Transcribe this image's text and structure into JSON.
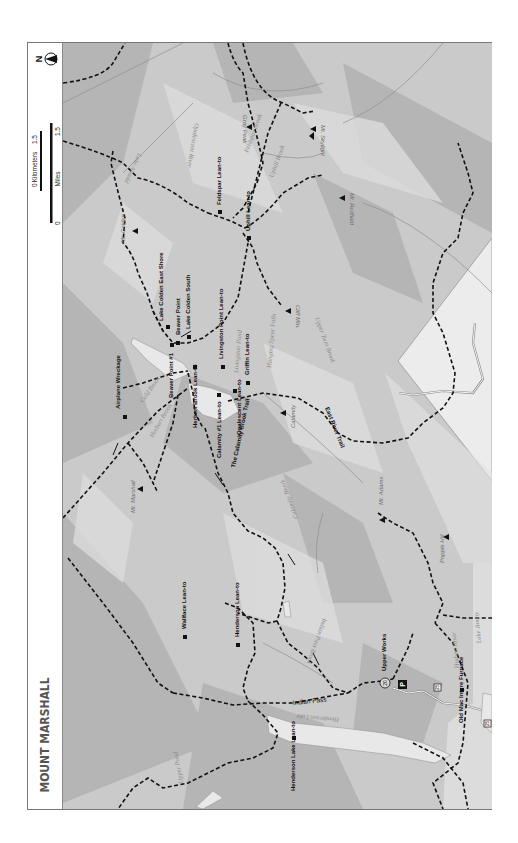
{
  "map": {
    "title": "MOUNT MARSHALL",
    "north_label": "N",
    "scale": {
      "km_label": "Kilometers",
      "km_start": "0",
      "km_end": "1.5",
      "mi_label": "Miles",
      "mi_start": "0",
      "mi_end": "1.5"
    },
    "colors": {
      "background": "#c9c9c9",
      "water": "#e6e6e6",
      "trail": "#111111",
      "label_water": "#8a8a8a",
      "label_peak": "#777777",
      "label_site": "#111111",
      "private_land": "#e9e9e9"
    },
    "lean_tos": [
      {
        "name": "Feldspar Lean-to"
      },
      {
        "name": "Uphill Lean-to"
      },
      {
        "name": "Lake Colden East Shore"
      },
      {
        "name": "Lake Colden South"
      },
      {
        "name": "Beaver Point"
      },
      {
        "name": "Beaver Point #1"
      },
      {
        "name": "Livingston Point Lean-to"
      },
      {
        "name": "Griffin Lean-to"
      },
      {
        "name": "Opalescent Lean-to"
      },
      {
        "name": "Herbert Brook Lean-to"
      },
      {
        "name": "Calamity #1 Lean-to"
      },
      {
        "name": "Airplane Wreckage"
      },
      {
        "name": "Wallface Lean-to"
      },
      {
        "name": "Henderson Lean-to"
      },
      {
        "name": "Henderson Lake Lean-to"
      },
      {
        "name": "Old Mac Intyre Furnace"
      }
    ],
    "peaks": [
      {
        "name": "Mt. Skylight"
      },
      {
        "name": "Gray Peak"
      },
      {
        "name": "Mt. Redfield"
      },
      {
        "name": "Mt. Colden"
      },
      {
        "name": "Cliff Mtn."
      },
      {
        "name": "Calamity"
      },
      {
        "name": "Mt. Marshall"
      },
      {
        "name": "Mt. Adams"
      },
      {
        "name": "Popple Hill"
      }
    ],
    "water": [
      {
        "name": "Lake Arnold"
      },
      {
        "name": "Opalescent River"
      },
      {
        "name": "Feldspar Brook"
      },
      {
        "name": "Uphill Brook"
      },
      {
        "name": "Allen Brook"
      },
      {
        "name": "Livingston Pond"
      },
      {
        "name": "Hanging Spear Falls"
      },
      {
        "name": "Upper Twin Brook"
      },
      {
        "name": "Cold Brook"
      },
      {
        "name": "Herbert Brook"
      },
      {
        "name": "Calamity Brook"
      },
      {
        "name": "Indian Pass Brook"
      },
      {
        "name": "Henderson Lake"
      },
      {
        "name": "Upper Pond"
      },
      {
        "name": "Hudson River"
      },
      {
        "name": "Lake Jimmy"
      }
    ],
    "trails": [
      {
        "name": "East River Trail"
      },
      {
        "name": "The Calamity Brook Trail"
      },
      {
        "name": "Indian Pass"
      }
    ],
    "routes": [
      {
        "number": "20"
      },
      {
        "number": "25"
      }
    ],
    "parking_label": "P",
    "upper_works": "Upper Works"
  }
}
